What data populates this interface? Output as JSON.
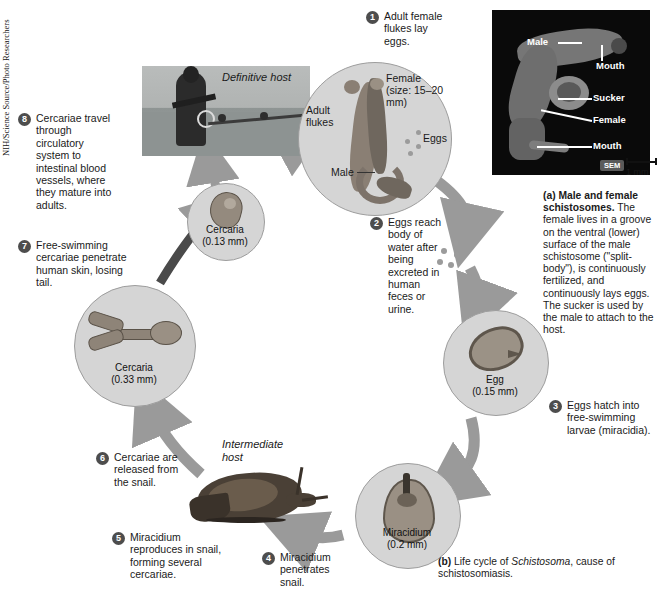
{
  "figure": {
    "title_a": "(a) Male and female schistosomes.",
    "caption_a": "The female lives in a groove on the ventral (lower) surface of the male schistosome (\"split-body\"), is continuously fertilized, and continuously lays eggs. The sucker is used by the male to attach to the host.",
    "caption_b_prefix": "(b)",
    "caption_b_text1": "Life cycle of",
    "caption_b_italic": "Schistosoma",
    "caption_b_text2": ", cause of schistosomiasis."
  },
  "inset": {
    "credit": "NIH/Science Source/Photo Researchers",
    "labels": {
      "male": "Male",
      "mouth_top": "Mouth",
      "sucker": "Sucker",
      "female": "Female",
      "mouth_bottom": "Mouth"
    },
    "scale_tag": "SEM",
    "scale_value": "1 mm"
  },
  "hosts": {
    "definitive": "Definitive host",
    "intermediate": "Intermediate host"
  },
  "steps": [
    {
      "number": "1",
      "text": "Adult female flukes lay eggs."
    },
    {
      "number": "2",
      "text": "Eggs reach body of water after being excreted in human feces or urine."
    },
    {
      "number": "3",
      "text": "Eggs hatch into free-swimming larvae (miracidia)."
    },
    {
      "number": "4",
      "text": "Miracidium penetrates snail."
    },
    {
      "number": "5",
      "text": "Miracidium reproduces in snail, forming several cercariae."
    },
    {
      "number": "6",
      "text": "Cercariae are released from the snail."
    },
    {
      "number": "7",
      "text": "Free-swimming cercariae penetrate human skin, losing tail."
    },
    {
      "number": "8",
      "text": "Cercariae travel through circulatory system to intestinal blood vessels, where they mature into adults."
    }
  ],
  "stages": {
    "adult_flukes": {
      "label": "Adult flukes",
      "female": "Female (size: 15–20 mm)",
      "male": "Male",
      "eggs": "Eggs"
    },
    "egg": {
      "name": "Egg",
      "size": "(0.15 mm)"
    },
    "miracidium": {
      "name": "Miracidium",
      "size": "(0.2 mm)"
    },
    "cercaria_large": {
      "name": "Cercaria",
      "size": "(0.33 mm)"
    },
    "cercaria_small": {
      "name": "Cercaria",
      "size": "(0.13 mm)"
    }
  },
  "colors": {
    "circle_fill": "#d5d5d5",
    "arrow_grey": "#9a9a9a",
    "badge": "#4d4d4d",
    "text": "#1a1a1a"
  }
}
